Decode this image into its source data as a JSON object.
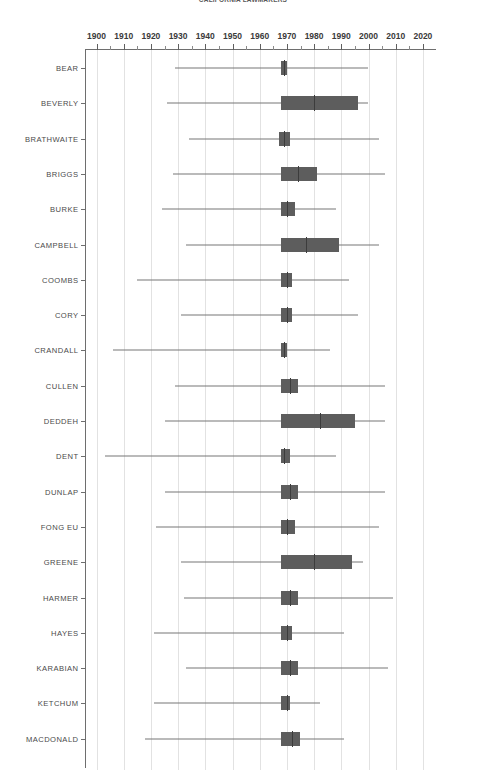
{
  "chart_data": {
    "type": "box",
    "title": "CALIFORNIA LAWMAKERS",
    "orientation": "horizontal",
    "xlabel": "",
    "ylabel": "",
    "xlim": [
      1897,
      2024
    ],
    "grid": true,
    "legend": false,
    "accent_color": "#5d5d5d",
    "whisker_color": "#767676",
    "grid_color": "#e2e2e2",
    "axis_color": "#6e6e6e",
    "x_ticks": [
      1900,
      1910,
      1920,
      1930,
      1940,
      1950,
      1960,
      1970,
      1980,
      1990,
      2000,
      2010,
      2020
    ],
    "x_minor_step": 5,
    "categories": [
      "BEAR",
      "BEVERLY",
      "BRATHWAITE",
      "BRIGGS",
      "BURKE",
      "CAMPBELL",
      "COOMBS",
      "CORY",
      "CRANDALL",
      "CULLEN",
      "DEDDEH",
      "DENT",
      "DUNLAP",
      "FONG EU",
      "GREENE",
      "HARMER",
      "HAYES",
      "KARABIAN",
      "KETCHUM",
      "MACDONALD"
    ],
    "boxes": [
      {
        "name": "BEAR",
        "min": 1929,
        "q1": 1968,
        "median": 1969,
        "q3": 1970,
        "max": 2000
      },
      {
        "name": "BEVERLY",
        "min": 1926,
        "q1": 1968,
        "median": 1980,
        "q3": 1996,
        "max": 2000
      },
      {
        "name": "BRATHWAITE",
        "min": 1934,
        "q1": 1967,
        "median": 1969,
        "q3": 1971,
        "max": 2004
      },
      {
        "name": "BRIGGS",
        "min": 1928,
        "q1": 1968,
        "median": 1974,
        "q3": 1981,
        "max": 2006
      },
      {
        "name": "BURKE",
        "min": 1924,
        "q1": 1968,
        "median": 1970,
        "q3": 1973,
        "max": 1988
      },
      {
        "name": "CAMPBELL",
        "min": 1933,
        "q1": 1968,
        "median": 1977,
        "q3": 1989,
        "max": 2004
      },
      {
        "name": "COOMBS",
        "min": 1915,
        "q1": 1968,
        "median": 1970,
        "q3": 1972,
        "max": 1993
      },
      {
        "name": "CORY",
        "min": 1931,
        "q1": 1968,
        "median": 1970,
        "q3": 1972,
        "max": 1996
      },
      {
        "name": "CRANDALL",
        "min": 1906,
        "q1": 1968,
        "median": 1969,
        "q3": 1970,
        "max": 1986
      },
      {
        "name": "CULLEN",
        "min": 1929,
        "q1": 1968,
        "median": 1971,
        "q3": 1974,
        "max": 2006
      },
      {
        "name": "DEDDEH",
        "min": 1925,
        "q1": 1968,
        "median": 1982,
        "q3": 1995,
        "max": 2006
      },
      {
        "name": "DENT",
        "min": 1903,
        "q1": 1968,
        "median": 1969,
        "q3": 1971,
        "max": 1988
      },
      {
        "name": "DUNLAP",
        "min": 1925,
        "q1": 1968,
        "median": 1971,
        "q3": 1974,
        "max": 2006
      },
      {
        "name": "FONG EU",
        "min": 1922,
        "q1": 1968,
        "median": 1970,
        "q3": 1973,
        "max": 2004
      },
      {
        "name": "GREENE",
        "min": 1931,
        "q1": 1968,
        "median": 1980,
        "q3": 1994,
        "max": 1998
      },
      {
        "name": "HARMER",
        "min": 1932,
        "q1": 1968,
        "median": 1971,
        "q3": 1974,
        "max": 2009
      },
      {
        "name": "HAYES",
        "min": 1921,
        "q1": 1968,
        "median": 1970,
        "q3": 1972,
        "max": 1991
      },
      {
        "name": "KARABIAN",
        "min": 1933,
        "q1": 1968,
        "median": 1971,
        "q3": 1974,
        "max": 2007
      },
      {
        "name": "KETCHUM",
        "min": 1921,
        "q1": 1968,
        "median": 1970,
        "q3": 1971,
        "max": 1982
      },
      {
        "name": "MACDONALD",
        "min": 1918,
        "q1": 1968,
        "median": 1972,
        "q3": 1975,
        "max": 1991
      }
    ]
  }
}
